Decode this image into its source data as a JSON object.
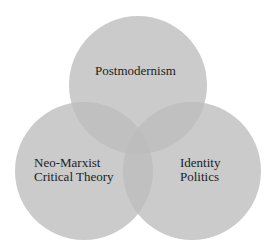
{
  "diagram": {
    "type": "venn",
    "background": "#ffffff",
    "circle_fill": "#bdbdbd",
    "circle_opacity": 0.78,
    "text_color": "#222222",
    "sets": [
      {
        "id": "postmodernism",
        "lines": [
          "Postmodernism"
        ],
        "cx": 138,
        "cy": 85,
        "r": 69
      },
      {
        "id": "neo-marxist-critical-theory",
        "lines": [
          "Neo-Marxist",
          "Critical Theory"
        ],
        "cx": 84,
        "cy": 171,
        "r": 69
      },
      {
        "id": "identity-politics",
        "lines": [
          "Identity",
          "Politics"
        ],
        "cx": 192,
        "cy": 171,
        "r": 69
      }
    ]
  }
}
